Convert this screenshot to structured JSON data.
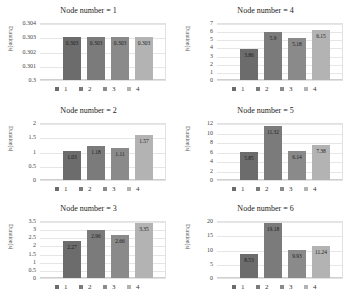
{
  "colors": {
    "s1": "#6c6c6c",
    "s2": "#7b7b7b",
    "s3": "#8a8a8a",
    "s4": "#b3b3b3"
  },
  "legend": [
    "1",
    "2",
    "3",
    "4"
  ],
  "ylabel": "Duration(s)",
  "chart_data": [
    {
      "type": "bar",
      "title": "Node number = 1",
      "categories": [
        "1",
        "2",
        "3",
        "4"
      ],
      "values": [
        0.303,
        0.303,
        0.303,
        0.303
      ],
      "labels": [
        "0.303",
        "0.303",
        "0.303",
        "0.303"
      ],
      "ylabel": "Duration(s)",
      "ylim": [
        0.3,
        0.304
      ],
      "yticks": [
        "0.3",
        "0.301",
        "0.302",
        "0.303",
        "0.304"
      ],
      "grid": true,
      "legend_position": "bottom"
    },
    {
      "type": "bar",
      "title": "Node number = 2",
      "categories": [
        "1",
        "2",
        "3",
        "4"
      ],
      "values": [
        1.03,
        1.18,
        1.11,
        1.57
      ],
      "labels": [
        "1.03",
        "1.18",
        "1.11",
        "1.57"
      ],
      "ylabel": "Duration(s)",
      "ylim": [
        0,
        2
      ],
      "yticks": [
        "0",
        "0.5",
        "1",
        "1.5",
        "2"
      ],
      "grid": true,
      "legend_position": "bottom"
    },
    {
      "type": "bar",
      "title": "Node number = 3",
      "categories": [
        "1",
        "2",
        "3",
        "4"
      ],
      "values": [
        2.27,
        2.96,
        2.66,
        3.35
      ],
      "labels": [
        "2.27",
        "2.96",
        "2.66",
        "3.35"
      ],
      "ylabel": "Duration(s)",
      "ylim": [
        0,
        3.5
      ],
      "yticks": [
        "0",
        "0.5",
        "1",
        "1.5",
        "2",
        "2.5",
        "3",
        "3.5"
      ],
      "grid": true,
      "legend_position": "bottom"
    },
    {
      "type": "bar",
      "title": "Node number = 4",
      "categories": [
        "1",
        "2",
        "3",
        "4"
      ],
      "values": [
        3.86,
        5.9,
        5.18,
        6.15
      ],
      "labels": [
        "3.86",
        "5.9",
        "5.18",
        "6.15"
      ],
      "ylabel": "Duration(s)",
      "ylim": [
        0,
        7
      ],
      "yticks": [
        "0",
        "1",
        "2",
        "3",
        "4",
        "5",
        "6",
        "7"
      ],
      "grid": true,
      "legend_position": "bottom"
    },
    {
      "type": "bar",
      "title": "Node number = 5",
      "categories": [
        "1",
        "2",
        "3",
        "4"
      ],
      "values": [
        5.85,
        11.32,
        6.14,
        7.38
      ],
      "labels": [
        "5.85",
        "11.32",
        "6.14",
        "7.38"
      ],
      "ylabel": "Duration(s)",
      "ylim": [
        0,
        12
      ],
      "yticks": [
        "0",
        "2",
        "4",
        "6",
        "8",
        "10",
        "12"
      ],
      "grid": true,
      "legend_position": "bottom"
    },
    {
      "type": "bar",
      "title": "Node number = 6",
      "categories": [
        "1",
        "2",
        "3",
        "4"
      ],
      "values": [
        8.53,
        19.18,
        9.93,
        11.24
      ],
      "labels": [
        "8.53",
        "19.18",
        "9.93",
        "11.24"
      ],
      "ylabel": "Duration(s)",
      "ylim": [
        0,
        20
      ],
      "yticks": [
        "0",
        "5",
        "10",
        "15",
        "20"
      ],
      "grid": true,
      "legend_position": "bottom"
    }
  ],
  "panels": [
    {
      "left": 0,
      "top": 0
    },
    {
      "left": 0,
      "top": 100
    },
    {
      "left": 0,
      "top": 198
    },
    {
      "left": 177,
      "top": 0
    },
    {
      "left": 177,
      "top": 100
    },
    {
      "left": 177,
      "top": 198
    }
  ]
}
